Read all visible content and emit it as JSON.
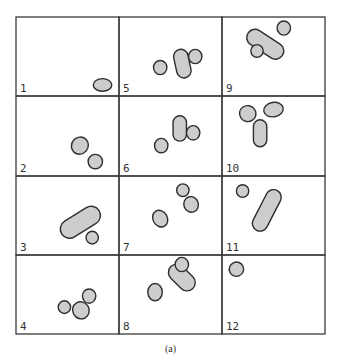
{
  "figure": {
    "caption": "(a)",
    "grid": {
      "rows": 4,
      "cols": 3,
      "order": "column-major"
    },
    "colors": {
      "blob_fill": "#cdcdcd",
      "blob_stroke": "#2e2e2e",
      "grid_line": "#3a3a3a",
      "label": "#333333"
    },
    "panels": [
      {
        "label": "1",
        "blobs": [
          {
            "shape": "ellipse",
            "cx": 0.84,
            "cy": 0.86,
            "rx": 0.09,
            "ry": 0.08,
            "rot": 0
          }
        ]
      },
      {
        "label": "2",
        "blobs": [
          {
            "shape": "ellipse",
            "cx": 0.62,
            "cy": 0.62,
            "rx": 0.08,
            "ry": 0.11,
            "rot": 40
          },
          {
            "shape": "ellipse",
            "cx": 0.77,
            "cy": 0.82,
            "rx": 0.07,
            "ry": 0.09,
            "rot": 0
          }
        ]
      },
      {
        "label": "3",
        "blobs": [
          {
            "shape": "capsule",
            "x1": 0.52,
            "y1": 0.67,
            "x2": 0.73,
            "y2": 0.5,
            "r": 0.09
          },
          {
            "shape": "ellipse",
            "cx": 0.74,
            "cy": 0.78,
            "rx": 0.06,
            "ry": 0.08,
            "rot": 0
          }
        ]
      },
      {
        "label": "4",
        "blobs": [
          {
            "shape": "ellipse",
            "cx": 0.47,
            "cy": 0.66,
            "rx": 0.06,
            "ry": 0.08,
            "rot": 0
          },
          {
            "shape": "ellipse",
            "cx": 0.63,
            "cy": 0.7,
            "rx": 0.08,
            "ry": 0.11,
            "rot": -30
          },
          {
            "shape": "ellipse",
            "cx": 0.71,
            "cy": 0.52,
            "rx": 0.065,
            "ry": 0.09,
            "rot": 0
          }
        ]
      },
      {
        "label": "5",
        "blobs": [
          {
            "shape": "ellipse",
            "cx": 0.4,
            "cy": 0.64,
            "rx": 0.065,
            "ry": 0.09,
            "rot": 0
          },
          {
            "shape": "capsule",
            "x1": 0.6,
            "y1": 0.5,
            "x2": 0.63,
            "y2": 0.68,
            "r": 0.07
          },
          {
            "shape": "ellipse",
            "cx": 0.74,
            "cy": 0.5,
            "rx": 0.065,
            "ry": 0.09,
            "rot": 0
          }
        ]
      },
      {
        "label": "6",
        "blobs": [
          {
            "shape": "ellipse",
            "cx": 0.41,
            "cy": 0.62,
            "rx": 0.065,
            "ry": 0.09,
            "rot": 0
          },
          {
            "shape": "capsule",
            "x1": 0.59,
            "y1": 0.33,
            "x2": 0.59,
            "y2": 0.48,
            "r": 0.065
          },
          {
            "shape": "ellipse",
            "cx": 0.72,
            "cy": 0.46,
            "rx": 0.065,
            "ry": 0.09,
            "rot": 0
          }
        ]
      },
      {
        "label": "7",
        "blobs": [
          {
            "shape": "ellipse",
            "cx": 0.4,
            "cy": 0.54,
            "rx": 0.07,
            "ry": 0.11,
            "rot": -30
          },
          {
            "shape": "ellipse",
            "cx": 0.62,
            "cy": 0.18,
            "rx": 0.06,
            "ry": 0.08,
            "rot": 0
          },
          {
            "shape": "ellipse",
            "cx": 0.7,
            "cy": 0.36,
            "rx": 0.07,
            "ry": 0.1,
            "rot": -20
          }
        ]
      },
      {
        "label": "8",
        "blobs": [
          {
            "shape": "ellipse",
            "cx": 0.35,
            "cy": 0.47,
            "rx": 0.07,
            "ry": 0.11,
            "rot": 0
          },
          {
            "shape": "capsule",
            "x1": 0.56,
            "y1": 0.22,
            "x2": 0.66,
            "y2": 0.35,
            "r": 0.08
          },
          {
            "shape": "ellipse",
            "cx": 0.61,
            "cy": 0.12,
            "rx": 0.065,
            "ry": 0.09,
            "rot": 0
          }
        ]
      },
      {
        "label": "9",
        "blobs": [
          {
            "shape": "capsule",
            "x1": 0.32,
            "y1": 0.26,
            "x2": 0.52,
            "y2": 0.43,
            "r": 0.08
          },
          {
            "shape": "ellipse",
            "cx": 0.6,
            "cy": 0.14,
            "rx": 0.065,
            "ry": 0.09,
            "rot": 0
          },
          {
            "shape": "ellipse",
            "cx": 0.34,
            "cy": 0.43,
            "rx": 0.06,
            "ry": 0.08,
            "rot": 0
          }
        ]
      },
      {
        "label": "10",
        "blobs": [
          {
            "shape": "ellipse",
            "cx": 0.25,
            "cy": 0.22,
            "rx": 0.08,
            "ry": 0.1,
            "rot": 10
          },
          {
            "shape": "ellipse",
            "cx": 0.5,
            "cy": 0.17,
            "rx": 0.095,
            "ry": 0.09,
            "rot": -10
          },
          {
            "shape": "capsule",
            "x1": 0.37,
            "y1": 0.38,
            "x2": 0.37,
            "y2": 0.55,
            "r": 0.065
          }
        ]
      },
      {
        "label": "11",
        "blobs": [
          {
            "shape": "ellipse",
            "cx": 0.2,
            "cy": 0.19,
            "rx": 0.06,
            "ry": 0.08,
            "rot": 0
          },
          {
            "shape": "capsule",
            "x1": 0.5,
            "y1": 0.27,
            "x2": 0.37,
            "y2": 0.6,
            "r": 0.075
          }
        ]
      },
      {
        "label": "12",
        "blobs": [
          {
            "shape": "ellipse",
            "cx": 0.14,
            "cy": 0.18,
            "rx": 0.07,
            "ry": 0.09,
            "rot": -25
          }
        ]
      }
    ]
  }
}
